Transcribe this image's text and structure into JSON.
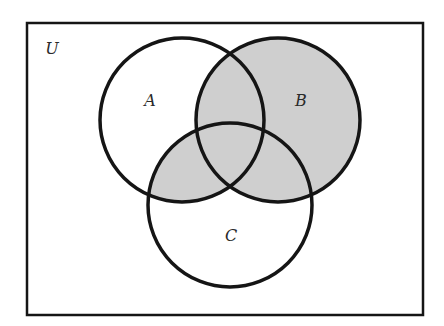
{
  "diagram": {
    "type": "venn",
    "universe": {
      "label": "U",
      "x": 27,
      "y": 23,
      "width": 396,
      "height": 292,
      "label_x": 52,
      "label_y": 54
    },
    "sets": [
      {
        "id": "A",
        "label": "A",
        "cx": 182,
        "cy": 120,
        "r": 82,
        "label_x": 150,
        "label_y": 105
      },
      {
        "id": "B",
        "label": "B",
        "cx": 278,
        "cy": 120,
        "r": 82,
        "label_x": 300,
        "label_y": 105
      },
      {
        "id": "C",
        "label": "C",
        "cx": 230,
        "cy": 205,
        "r": 82,
        "label_x": 230,
        "label_y": 240
      }
    ],
    "shaded_region": "B ∪ (A ∩ C)",
    "colors": {
      "stroke": "#151515",
      "shade": "#cfcfcf",
      "background": "#ffffff"
    }
  }
}
